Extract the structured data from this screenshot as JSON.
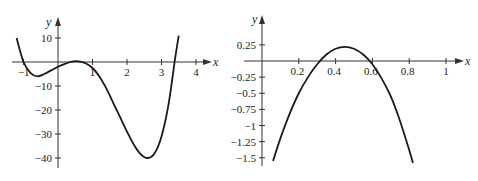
{
  "chart_data": [
    {
      "type": "line",
      "title": "",
      "xlabel": "x",
      "ylabel": "y",
      "xlim": [
        -1.2,
        4.3
      ],
      "ylim": [
        -43,
        14
      ],
      "grid": false,
      "x_ticks": [
        "-1",
        "1",
        "2",
        "3",
        "4"
      ],
      "y_ticks": [
        "10",
        "-10",
        "-20",
        "-30",
        "-40"
      ],
      "series": [
        {
          "name": "f(x)",
          "x": [
            -1.2,
            -1.0,
            -0.8,
            -0.6,
            -0.4,
            -0.2,
            0.0,
            0.2,
            0.4,
            0.6,
            0.8,
            1.0,
            1.2,
            1.4,
            1.6,
            1.8,
            2.0,
            2.2,
            2.4,
            2.6,
            2.8,
            3.0,
            3.2,
            3.4,
            3.5
          ],
          "y": [
            10,
            0,
            -4.5,
            -6,
            -5,
            -3.5,
            -2,
            -0.8,
            0.2,
            0.3,
            -0.5,
            -2.5,
            -6,
            -11,
            -17,
            -23,
            -29,
            -34.5,
            -38.5,
            -40,
            -38,
            -31,
            -18,
            2,
            11
          ]
        }
      ]
    },
    {
      "type": "line",
      "title": "",
      "xlabel": "x",
      "ylabel": "y",
      "xlim": [
        -0.01,
        1.08
      ],
      "ylim": [
        -1.6,
        0.4
      ],
      "grid": false,
      "x_ticks": [
        "0.2",
        "0.4",
        "0.6",
        "0.8",
        "1"
      ],
      "y_ticks": [
        "0.25",
        "-0.25",
        "-0.5",
        "-0.75",
        "-1",
        "-1.25",
        "-1.5"
      ],
      "series": [
        {
          "name": "g(x)",
          "x": [
            0.06,
            0.1,
            0.15,
            0.2,
            0.25,
            0.3,
            0.35,
            0.4,
            0.45,
            0.5,
            0.55,
            0.6,
            0.65,
            0.7,
            0.75,
            0.8,
            0.82
          ],
          "y": [
            -1.55,
            -1.2,
            -0.82,
            -0.5,
            -0.25,
            -0.05,
            0.1,
            0.19,
            0.22,
            0.19,
            0.1,
            -0.05,
            -0.27,
            -0.55,
            -0.93,
            -1.38,
            -1.58
          ]
        }
      ]
    }
  ]
}
